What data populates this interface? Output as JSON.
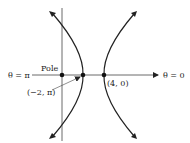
{
  "diagram": {
    "axis_labels": {
      "left": "θ = π",
      "right": "θ = 0",
      "pole": "Pole"
    },
    "points": [
      {
        "id": "pole",
        "label": "Pole",
        "r": 0,
        "theta": "0"
      },
      {
        "id": "left-vertex",
        "label": "(−2, π)",
        "r": -2,
        "theta": "π"
      },
      {
        "id": "right-vertex",
        "label": "(4, 0)",
        "r": 4,
        "theta": "0"
      }
    ],
    "curve": "hyperbola with two branches, vertices at (−2, π) and (4, 0)",
    "colors": {
      "line": "#222222",
      "background": "#ffffff"
    }
  }
}
